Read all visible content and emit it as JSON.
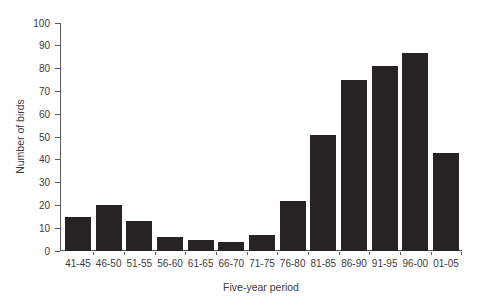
{
  "chart_data": {
    "type": "bar",
    "title": "",
    "xlabel": "Five-year period",
    "ylabel": "Number of birds",
    "categories": [
      "41-45",
      "46-50",
      "51-55",
      "56-60",
      "61-65",
      "66-70",
      "71-75",
      "76-80",
      "81-85",
      "86-90",
      "91-95",
      "96-00",
      "01-05"
    ],
    "values": [
      15,
      20,
      13,
      6,
      5,
      4,
      7,
      22,
      51,
      75,
      81,
      87,
      43
    ],
    "ylim": [
      0,
      100
    ],
    "ytick_step": 10,
    "grid": false,
    "legend": "none",
    "bar_color": "#272324",
    "axis_color": "#58595b",
    "text_color": "#3d3a3b",
    "background": "#ffffff"
  }
}
